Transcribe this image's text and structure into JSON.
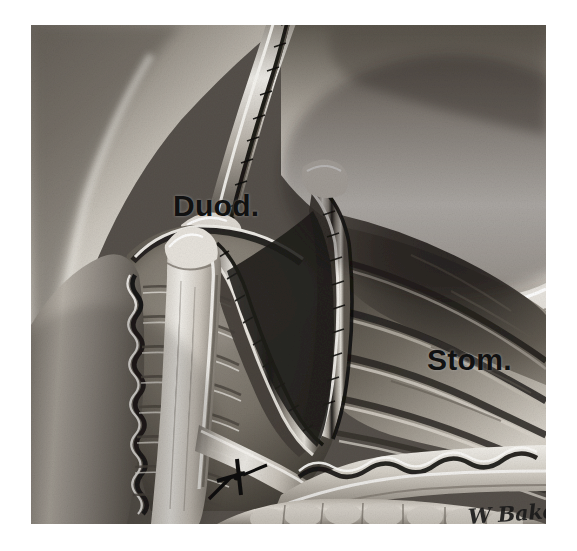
{
  "figure": {
    "kind": "medical-illustration",
    "medium": "grayscale airbrush / halftone print",
    "background_color": "#ffffff",
    "plate": {
      "x": 31,
      "y": 25,
      "width": 515,
      "height": 499,
      "border": "none"
    },
    "labels": [
      {
        "id": "duod",
        "text": "Duod.",
        "meaning": "Duodenum",
        "x": 142,
        "y": 166,
        "font_size_px": 30,
        "weight": "bold",
        "color": "#111111"
      },
      {
        "id": "stom",
        "text": "Stom.",
        "meaning": "Stomach",
        "x": 396,
        "y": 320,
        "font_size_px": 30,
        "weight": "bold",
        "color": "#111111"
      }
    ],
    "signature": {
      "text": "W Baker",
      "style": "cursive handwriting",
      "x": 437,
      "y": 479,
      "color": "#1a1a1a"
    },
    "palette": {
      "white_margin": "#ffffff",
      "highlight": "#f2f0ec",
      "serosa_light": "#d8d4cd",
      "tissue_mid": "#9a958d",
      "tissue_shadow": "#555049",
      "lumen_dark": "#2a2724",
      "deep_black": "#121110",
      "suture_black": "#101010"
    },
    "regions": [
      {
        "name": "duodenal-wall-left",
        "description": "Left duodenal wall with transverse valvulae conniventes and wavy mucosal edge"
      },
      {
        "name": "duodenal-lumen",
        "description": "Open duodenal lumen, mid-gray shaded cavity, labelled Duod."
      },
      {
        "name": "gastric-lumen",
        "description": "Dark stomach interior with diagonal rugal folds, labelled Stom."
      },
      {
        "name": "incision-v",
        "description": "Central V-shaped cut edge with paired stapled / sutured margins"
      },
      {
        "name": "duodenal-flap",
        "description": "Mobilised pale duodenal flap rising at left of the V"
      },
      {
        "name": "superior-cut-edge",
        "description": "Upper divided wall with dark running suture line crossing the top border"
      },
      {
        "name": "inferior-serosa",
        "description": "Lower scalloped serosal rim running right across the field"
      },
      {
        "name": "omental-fat",
        "description": "Lobulated omental fat along the bottom of the plate"
      },
      {
        "name": "suture-knot",
        "description": "Single dark tied suture knot with thread tails on the lower duodenal flap"
      }
    ]
  }
}
